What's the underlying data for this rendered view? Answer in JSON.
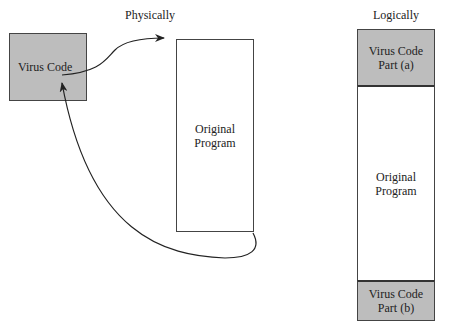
{
  "physical": {
    "heading": "Physically",
    "virus_box": {
      "label": "Virus Code",
      "fill": "#bdbdbd"
    },
    "program_box": {
      "line1": "Original",
      "line2": "Program"
    }
  },
  "logical": {
    "heading": "Logically",
    "part_a": {
      "line1": "Virus Code",
      "line2": "Part (a)"
    },
    "middle": {
      "line1": "Original",
      "line2": "Program"
    },
    "part_b": {
      "line1": "Virus Code",
      "line2": "Part (b)"
    }
  }
}
